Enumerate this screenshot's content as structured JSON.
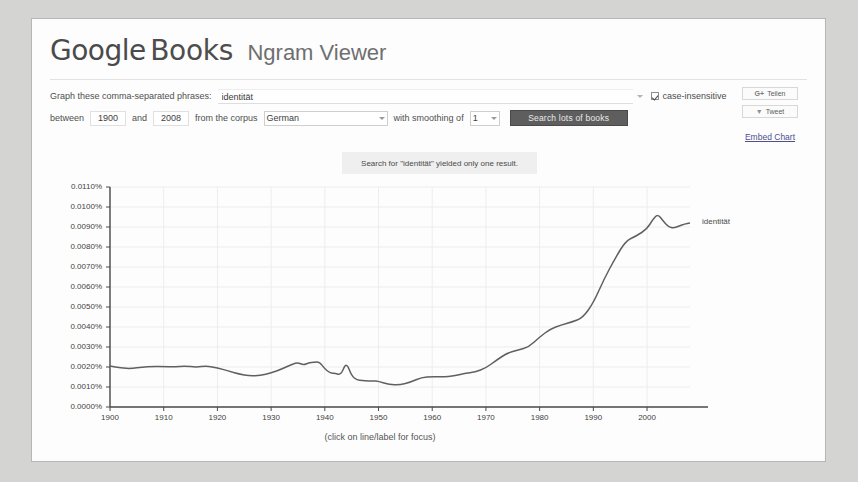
{
  "app": {
    "logo_google": "Google",
    "logo_books": "Books",
    "logo_ngram": "Ngram Viewer"
  },
  "form": {
    "phrases_label": "Graph these comma-separated phrases:",
    "phrases_value": "identität",
    "case_insensitive_label": "case-insensitive",
    "between_label": "between",
    "start_year": "1900",
    "and_label": "and",
    "end_year": "2008",
    "corpus_label": "from the corpus",
    "corpus_value": "German",
    "smoothing_label": "with smoothing of",
    "smoothing_value": "1",
    "search_button": "Search lots of books"
  },
  "share": {
    "gplus_glyph": "G+",
    "gplus_label": "Teilen",
    "twitter_glyph": "▼",
    "twitter_label": "Tweet",
    "embed_label": "Embed Chart"
  },
  "notice": {
    "text": "Search for \"identität\" yielded only one result."
  },
  "chart_caption": "(click on line/label for focus)",
  "colors": {
    "line": "#606060",
    "grid": "#ededed",
    "axis": "#4a4a4a",
    "button": "#5e5e5e",
    "link": "#4f4f8f"
  },
  "chart_data": {
    "type": "line",
    "title": "",
    "xlabel": "",
    "ylabel": "",
    "xlim": [
      1900,
      2008
    ],
    "ylim": [
      0.0,
      0.011
    ],
    "grid": true,
    "legend_position": "right-of-line",
    "yticks": [
      "0.0000%",
      "0.0010%",
      "0.0020%",
      "0.0030%",
      "0.0040%",
      "0.0050%",
      "0.0060%",
      "0.0070%",
      "0.0080%",
      "0.0090%",
      "0.0100%",
      "0.0110%"
    ],
    "ytick_values": [
      0.0,
      0.001,
      0.002,
      0.003,
      0.004,
      0.005,
      0.006,
      0.007,
      0.008,
      0.009,
      0.01,
      0.011
    ],
    "xticks": [
      "1900",
      "1910",
      "1920",
      "1930",
      "1940",
      "1950",
      "1960",
      "1970",
      "1980",
      "1990",
      "2000"
    ],
    "xtick_values": [
      1900,
      1910,
      1920,
      1930,
      1940,
      1950,
      1960,
      1970,
      1980,
      1990,
      2000
    ],
    "series": [
      {
        "name": "identität",
        "label": "identität",
        "color": "#606060",
        "x": [
          1900,
          1902,
          1904,
          1906,
          1908,
          1910,
          1912,
          1914,
          1916,
          1918,
          1920,
          1922,
          1924,
          1926,
          1928,
          1930,
          1932,
          1934,
          1935,
          1936,
          1937,
          1938,
          1939,
          1940,
          1941,
          1942,
          1943,
          1944,
          1945,
          1946,
          1947,
          1948,
          1949,
          1950,
          1952,
          1954,
          1956,
          1958,
          1960,
          1962,
          1964,
          1966,
          1968,
          1970,
          1972,
          1974,
          1976,
          1978,
          1980,
          1982,
          1984,
          1986,
          1988,
          1990,
          1992,
          1994,
          1996,
          1998,
          2000,
          2001,
          2002,
          2003,
          2004,
          2005,
          2006,
          2007,
          2008
        ],
        "y": [
          0.00205,
          0.00195,
          0.00192,
          0.002,
          0.00203,
          0.00202,
          0.00201,
          0.00205,
          0.00199,
          0.00205,
          0.00196,
          0.0018,
          0.00165,
          0.00155,
          0.00158,
          0.0017,
          0.0019,
          0.00215,
          0.00222,
          0.0021,
          0.0022,
          0.00224,
          0.00226,
          0.0019,
          0.0017,
          0.00168,
          0.0016,
          0.00225,
          0.00155,
          0.00135,
          0.00132,
          0.0013,
          0.00131,
          0.00128,
          0.00112,
          0.0011,
          0.00125,
          0.00148,
          0.00152,
          0.0015,
          0.00155,
          0.00168,
          0.00175,
          0.00195,
          0.00235,
          0.0027,
          0.00285,
          0.003,
          0.0035,
          0.0039,
          0.0041,
          0.00425,
          0.00445,
          0.0052,
          0.0064,
          0.0074,
          0.0083,
          0.00855,
          0.0089,
          0.00935,
          0.00965,
          0.0093,
          0.009,
          0.00895,
          0.00905,
          0.00915,
          0.0092
        ]
      }
    ]
  }
}
